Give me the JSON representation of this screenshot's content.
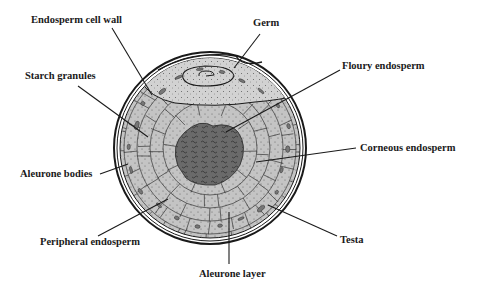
{
  "diagram": {
    "colors": {
      "background": "#ffffff",
      "outline": "#1a1a1a",
      "germ": "#d4d4d4",
      "endosperm": "#c8c8c8",
      "floury_core": "#6e6e6e",
      "aleurone_bodies": "#7a7a7a",
      "leader_line": "#1a1a1a"
    },
    "labels": {
      "endosperm_cell_wall": "Endosperm cell wall",
      "germ": "Germ",
      "starch_granules": "Starch granules",
      "floury_endosperm": "Floury endosperm",
      "corneous_endosperm": "Corneous endosperm",
      "aleurone_bodies": "Aleurone bodies",
      "peripheral_endosperm": "Peripheral endosperm",
      "testa": "Testa",
      "aleurone_layer": "Aleurone layer"
    }
  }
}
